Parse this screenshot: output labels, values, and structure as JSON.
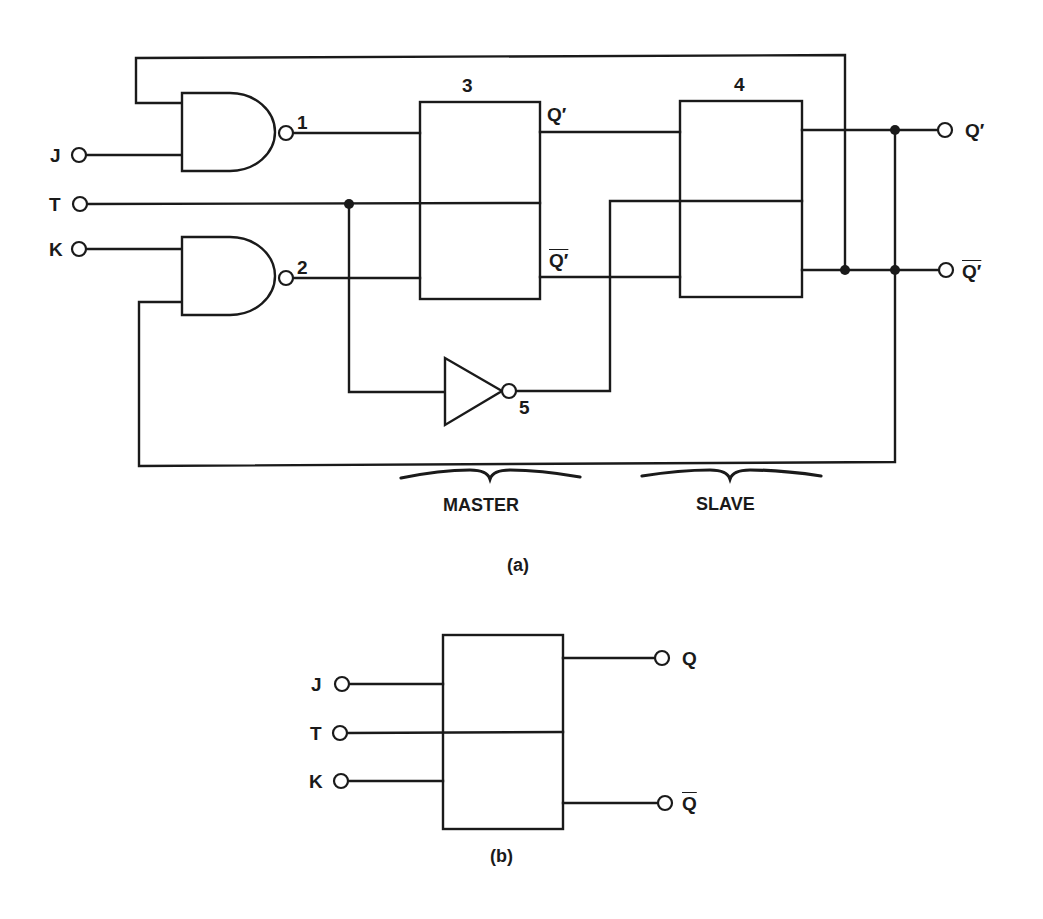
{
  "figure_a": {
    "caption": "(a)",
    "inputs": {
      "j": "J",
      "t": "T",
      "k": "K"
    },
    "gates": {
      "nand1": "1",
      "nand2": "2",
      "not5": "5"
    },
    "blocks": {
      "master_ff": "3",
      "slave_ff": "4"
    },
    "master_outputs": {
      "q": "Q′",
      "q_bar": "Q′"
    },
    "outputs": {
      "q": "Q′",
      "q_bar": "Q′"
    },
    "section_labels": {
      "master": "MASTER",
      "slave": "SLAVE"
    }
  },
  "figure_b": {
    "caption": "(b)",
    "inputs": {
      "j": "J",
      "t": "T",
      "k": "K"
    },
    "outputs": {
      "q": "Q",
      "q_bar": "Q"
    }
  },
  "colors": {
    "ink": "#1a1a1a",
    "background": "#ffffff"
  }
}
